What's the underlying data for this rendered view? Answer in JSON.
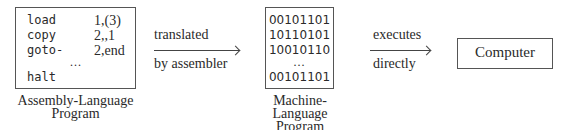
{
  "assembly_program": {
    "lines": [
      {
        "op": "load",
        "arg": "1,(3)"
      },
      {
        "op": "copy",
        "arg": "2,,1"
      },
      {
        "op": "goto-",
        "arg": "2,end"
      }
    ],
    "ellipsis": "...",
    "last_line": {
      "op": "halt",
      "arg": ""
    },
    "caption_line1": "Assembly-Language",
    "caption_line2": "Program"
  },
  "arrow1": {
    "label_top": "translated",
    "label_bottom": "by assembler"
  },
  "machine_program": {
    "lines": [
      "00101101",
      "10110101",
      "10010110"
    ],
    "ellipsis": "...",
    "last_line": "00101101",
    "caption_line1": "Machine-Language",
    "caption_line2": "Program"
  },
  "arrow2": {
    "label_top": "executes",
    "label_bottom": "directly"
  },
  "computer": {
    "label": "Computer"
  }
}
